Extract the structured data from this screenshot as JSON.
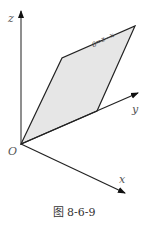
{
  "figure": {
    "caption": "图 8-6-9",
    "axes": {
      "x_label": "x",
      "y_label": "y",
      "z_label": "z",
      "origin_label": "O"
    },
    "plane": {
      "label": "x−z=0",
      "fill_color": "#e8e8e8",
      "stroke_color": "#222222"
    }
  }
}
